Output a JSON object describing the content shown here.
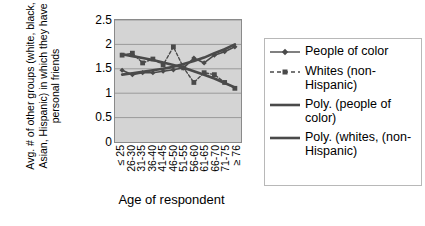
{
  "chart_data": {
    "type": "line",
    "title": "",
    "xlabel": "Age of respondent",
    "ylabel": "Avg. # of other groups (white, black, Asian, Hispanic) in which they have personal friends",
    "categories": [
      "≤ 25",
      "26-30",
      "31-35",
      "36-40",
      "41-45",
      "46-50",
      "51-55",
      "56-60",
      "61-65",
      "66-70",
      "71-75",
      "≥ 76"
    ],
    "ylim": [
      0,
      2.5
    ],
    "yticks": [
      "0",
      "0.5",
      "1",
      "1.5",
      "2",
      "2.5"
    ],
    "ytick_values": [
      0,
      0.5,
      1,
      1.5,
      2,
      2.5
    ],
    "grid": "horizontal",
    "legend_position": "right",
    "plot_background": "#d4d4d4",
    "series_color": "#4a4a4a",
    "series": [
      {
        "name": "People of color",
        "marker": "diamond",
        "style": "solid-thin",
        "values": [
          1.47,
          1.38,
          1.42,
          1.42,
          1.45,
          1.48,
          1.52,
          1.72,
          1.62,
          1.78,
          1.85,
          1.95
        ]
      },
      {
        "name": "Whites (non-Hispanic)",
        "marker": "square",
        "style": "dashed",
        "values": [
          1.78,
          1.82,
          1.62,
          1.7,
          1.58,
          1.95,
          1.52,
          1.22,
          1.42,
          1.38,
          1.22,
          1.1
        ]
      },
      {
        "name": "Poly. (people of color)",
        "marker": "none",
        "style": "solid-thick",
        "values": [
          1.38,
          1.41,
          1.44,
          1.47,
          1.5,
          1.54,
          1.6,
          1.66,
          1.73,
          1.82,
          1.9,
          2.0
        ]
      },
      {
        "name": "Poly. (whites, (non-Hispanic)",
        "marker": "none",
        "style": "solid-thick",
        "values": [
          1.8,
          1.76,
          1.72,
          1.68,
          1.63,
          1.58,
          1.52,
          1.45,
          1.38,
          1.3,
          1.21,
          1.12
        ]
      }
    ]
  },
  "legend": {
    "items": [
      {
        "label": "People of color",
        "key": "diamond-line-key"
      },
      {
        "label": "Whites (non-Hispanic)",
        "key": "square-dashed-key"
      },
      {
        "label": "Poly. (people of color)",
        "key": "thick-line-key"
      },
      {
        "label": "Poly. (whites, (non-Hispanic)",
        "key": "thick-line-key"
      }
    ]
  }
}
